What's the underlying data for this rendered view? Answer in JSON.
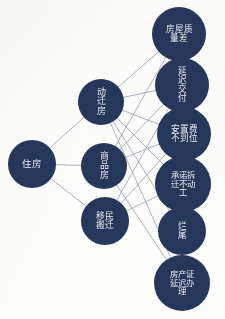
{
  "diagram": {
    "type": "node-link-graph",
    "background_color": "#fdfdfc",
    "node_color": "#26375c",
    "node_text_color": "#eef1f6",
    "edge_color": "#8a93a8",
    "nodes": [
      {
        "id": "n0",
        "label": "住房",
        "level": 0,
        "cx": 32,
        "cy": 164,
        "r": 24,
        "font_size": 9.5,
        "box_w": 26
      },
      {
        "id": "n1",
        "label": "动迁房",
        "level": 1,
        "cx": 101,
        "cy": 102,
        "r": 23,
        "font_size": 9.0,
        "box_w": 13
      },
      {
        "id": "n2",
        "label": "商品房",
        "level": 1,
        "cx": 104,
        "cy": 166,
        "r": 23,
        "font_size": 9.0,
        "box_w": 13
      },
      {
        "id": "n3",
        "label": "移民搬迁",
        "level": 1,
        "cx": 105,
        "cy": 221,
        "r": 24,
        "font_size": 8.8,
        "box_w": 26
      },
      {
        "id": "n4",
        "label": "房屋质量差",
        "level": 2,
        "cx": 179,
        "cy": 34,
        "r": 27,
        "font_size": 8.6,
        "box_w": 28
      },
      {
        "id": "n5",
        "label": "延迟交付",
        "level": 2,
        "cx": 182,
        "cy": 85,
        "r": 27,
        "font_size": 8.6,
        "box_w": 14
      },
      {
        "id": "n6",
        "label": "安置费不到位",
        "level": 2,
        "cx": 184,
        "cy": 134,
        "r": 27,
        "font_size": 8.6,
        "box_w": 28
      },
      {
        "id": "n7",
        "label": "承诺拆迁不动工",
        "level": 2,
        "cx": 183,
        "cy": 184,
        "r": 28,
        "font_size": 8.4,
        "box_w": 28
      },
      {
        "id": "n8",
        "label": "烂尾",
        "level": 2,
        "cx": 182,
        "cy": 231,
        "r": 24,
        "font_size": 8.6,
        "box_w": 14
      },
      {
        "id": "n9",
        "label": "房产证延迟办理",
        "level": 2,
        "cx": 182,
        "cy": 283,
        "r": 28,
        "font_size": 8.4,
        "box_w": 28
      }
    ],
    "edges": [
      {
        "from": "n0",
        "to": "n1"
      },
      {
        "from": "n0",
        "to": "n2"
      },
      {
        "from": "n0",
        "to": "n3"
      },
      {
        "from": "n1",
        "to": "n4"
      },
      {
        "from": "n1",
        "to": "n5"
      },
      {
        "from": "n1",
        "to": "n6"
      },
      {
        "from": "n1",
        "to": "n7"
      },
      {
        "from": "n1",
        "to": "n8"
      },
      {
        "from": "n1",
        "to": "n9"
      },
      {
        "from": "n2",
        "to": "n4"
      },
      {
        "from": "n2",
        "to": "n5"
      },
      {
        "from": "n2",
        "to": "n6"
      },
      {
        "from": "n2",
        "to": "n9"
      },
      {
        "from": "n3",
        "to": "n5"
      },
      {
        "from": "n3",
        "to": "n6"
      },
      {
        "from": "n3",
        "to": "n7"
      }
    ]
  }
}
